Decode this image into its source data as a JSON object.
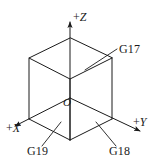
{
  "figure": {
    "type": "isometric-cube-coordinate-diagram",
    "background_color": "#ffffff",
    "stroke_color": "#1a1a1a",
    "origin_label": "O",
    "axes": [
      {
        "name": "x-axis",
        "label": "+X",
        "sign": "+",
        "letter": "X",
        "direction": "down-left"
      },
      {
        "name": "y-axis",
        "label": "+Y",
        "sign": "+",
        "letter": "Y",
        "direction": "down-right"
      },
      {
        "name": "z-axis",
        "label": "+Z",
        "sign": "+",
        "letter": "Z",
        "direction": "up"
      }
    ],
    "part_labels": [
      {
        "name": "g17",
        "label": "G17",
        "points_to": "upper-right-face"
      },
      {
        "name": "g18",
        "label": "G18",
        "points_to": "lower-right-face"
      },
      {
        "name": "g19",
        "label": "G19",
        "points_to": "lower-left-face"
      }
    ]
  }
}
